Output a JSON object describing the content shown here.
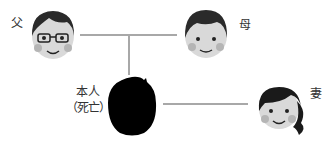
{
  "diagram": {
    "type": "family-tree",
    "nodes": [
      {
        "id": "father",
        "label": "父"
      },
      {
        "id": "mother",
        "label": "母"
      },
      {
        "id": "self",
        "label_line1": "本人",
        "label_line2": "（死亡）",
        "deceased": true
      },
      {
        "id": "wife",
        "label": "妻"
      }
    ],
    "edges": [
      {
        "from": "father",
        "to": "mother",
        "kind": "marriage"
      },
      {
        "from": "father-mother",
        "to": "self",
        "kind": "child"
      },
      {
        "from": "self",
        "to": "wife",
        "kind": "marriage"
      }
    ],
    "colors": {
      "line": "#a8a8a8",
      "hair": "#2a2a2a",
      "skin": "#d9d9d9",
      "cheek": "#b5b5b5",
      "silhouette": "#000000"
    }
  }
}
